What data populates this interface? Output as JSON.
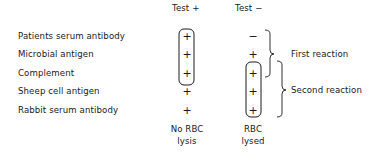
{
  "columns": {
    "test_positive": "Test +",
    "test_negative": "Test −"
  },
  "rows": [
    {
      "label": "Patients serum antibody",
      "test_positive": "+",
      "test_negative": "−"
    },
    {
      "label": "Microbial antigen",
      "test_positive": "+",
      "test_negative": "+"
    },
    {
      "label": "Complement",
      "test_positive": "+",
      "test_negative": "+"
    },
    {
      "label": "Sheep cell antigen",
      "test_positive": "+",
      "test_negative": "+"
    },
    {
      "label": "Rabbit serum antibody",
      "test_positive": "+",
      "test_negative": "+"
    }
  ],
  "brackets": {
    "first": "First reaction",
    "second": "Second reaction"
  },
  "outcomes": {
    "test_positive_line1": "No RBC",
    "test_positive_line2": "lysis",
    "test_negative_line1": "RBC",
    "test_negative_line2": "lysed"
  }
}
